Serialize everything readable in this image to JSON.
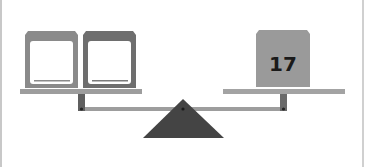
{
  "diagram": {
    "type": "balance-scale",
    "left_pan": {
      "boxes": [
        {
          "label": "",
          "fill": "#8a8a8a",
          "slot": "blank"
        },
        {
          "label": "",
          "fill": "#6e6e6e",
          "slot": "blank"
        }
      ]
    },
    "right_pan": {
      "boxes": [
        {
          "label": "17",
          "fill": "#9a9a9a"
        }
      ]
    },
    "colors": {
      "beam": "#9d9d9d",
      "stem": "#5f5f5f",
      "fulcrum": "#444444",
      "text": "#1a1a1a"
    }
  }
}
